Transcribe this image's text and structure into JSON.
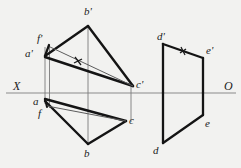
{
  "figure": {
    "kind": "descriptive-geometry-orthographic-projection",
    "background_color": "#f2f2f0",
    "ink_color": "#1b1b1b",
    "thin_color": "#6f6f6f",
    "axis": {
      "name": "ground-line",
      "left_label": "X",
      "right_label": "O",
      "y": 93,
      "x_start": 6,
      "x_end": 236,
      "color": "#8a8a8a"
    },
    "labels": {
      "b_prime": "b'",
      "f_prime": "f'",
      "a_prime": "a'",
      "c_prime": "c'",
      "a": "a",
      "f": "f",
      "b": "b",
      "c": "c",
      "d_prime": "d'",
      "e_prime": "e'",
      "d": "d",
      "e": "e"
    },
    "label_positions": {
      "b_prime": [
        84,
        6
      ],
      "f_prime": [
        37,
        36
      ],
      "a_prime": [
        26,
        48
      ],
      "c_prime": [
        136,
        79
      ],
      "a": [
        32,
        97
      ],
      "f": [
        38,
        110
      ],
      "b": [
        83,
        152
      ],
      "c": [
        130,
        117
      ],
      "d_prime": [
        158,
        33
      ],
      "e_prime": [
        207,
        47
      ],
      "d": [
        153,
        148
      ],
      "e": [
        206,
        121
      ],
      "X": [
        13,
        82
      ],
      "O": [
        224,
        82
      ]
    },
    "points_top_view": {
      "a_prime": [
        45,
        56
      ],
      "b_prime": [
        88,
        26
      ],
      "c_prime": [
        133,
        86
      ],
      "f_prime": [
        48,
        45
      ]
    },
    "points_bottom_view": {
      "a": [
        45,
        99
      ],
      "b": [
        88,
        144
      ],
      "c": [
        126,
        121
      ],
      "f": [
        47,
        105
      ]
    },
    "points_right_upper": {
      "d_prime": [
        163,
        44
      ],
      "e_prime": [
        203,
        58
      ]
    },
    "points_right_lower": {
      "d": [
        163,
        143
      ],
      "e": [
        203,
        115
      ]
    },
    "tick_marks": [
      {
        "name": "tick-af-upper",
        "x": 78,
        "y": 61
      },
      {
        "name": "tick-de-upper",
        "x": 183,
        "y": 51
      }
    ]
  }
}
